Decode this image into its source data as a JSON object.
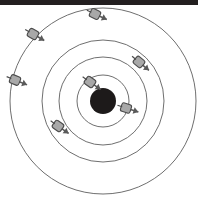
{
  "figure": {
    "canvas": {
      "width": 198,
      "height": 200,
      "background": "#ffffff"
    },
    "scan_band": {
      "present": true,
      "color": "#231f20",
      "height": 5
    },
    "colors": {
      "nucleus": "#1d1a1a",
      "orbit_stroke": "#6f6f6f",
      "electron_fill": "#a8a8a8",
      "electron_stroke": "#4a4a4a",
      "arrow_stroke": "#5a5a5a",
      "background": "#ffffff"
    }
  },
  "chart_data": {
    "type": "scatter",
    "subtitle": "",
    "xlabel": "",
    "ylabel": "",
    "grid": false,
    "legend": "none",
    "xlim": [
      0,
      198
    ],
    "ylim": [
      0,
      200
    ],
    "center": {
      "x": 103,
      "y": 101
    },
    "nucleus": {
      "cx": 103,
      "cy": 101,
      "r": 13,
      "fill": "#1d1a1a",
      "label": "nucleus"
    },
    "orbits": [
      {
        "name": "shell-1",
        "r": 26,
        "stroke": "#6f6f6f"
      },
      {
        "name": "shell-2",
        "r": 44,
        "stroke": "#6f6f6f"
      },
      {
        "name": "shell-3",
        "r": 61,
        "stroke": "#6f6f6f"
      },
      {
        "name": "shell-4",
        "r": 93,
        "stroke": "#6f6f6f"
      }
    ],
    "electrons": [
      {
        "name": "electron-1",
        "shell": 1,
        "cx": 90,
        "cy": 82,
        "angle_deg": 123,
        "arrow_deg": 35,
        "r": 5
      },
      {
        "name": "electron-2",
        "shell": 1,
        "cx": 126,
        "cy": 108,
        "angle_deg": -17,
        "arrow_deg": 18,
        "r": 5
      },
      {
        "name": "electron-3",
        "shell": 2,
        "cx": 58,
        "cy": 126,
        "angle_deg": 210,
        "arrow_deg": 35,
        "r": 5
      },
      {
        "name": "electron-4",
        "shell": 3,
        "cx": 139,
        "cy": 62,
        "angle_deg": 57,
        "arrow_deg": 40,
        "r": 5
      },
      {
        "name": "electron-5",
        "shell": 4,
        "cx": 95,
        "cy": 14,
        "angle_deg": 95,
        "arrow_deg": 25,
        "r": 5
      },
      {
        "name": "electron-6",
        "shell": 4,
        "cx": 33,
        "cy": 34,
        "angle_deg": 138,
        "arrow_deg": 30,
        "r": 5
      },
      {
        "name": "electron-7",
        "shell": 4,
        "cx": 15,
        "cy": 80,
        "angle_deg": 166,
        "arrow_deg": 22,
        "r": 5
      }
    ]
  }
}
